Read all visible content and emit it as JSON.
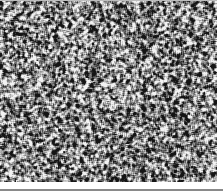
{
  "image": {
    "description": "grayscale speckle texture",
    "width": 217,
    "height": 182,
    "palette": {
      "dark": "#141414",
      "mid": "#8c8c8c",
      "light": "#f2f2f2"
    },
    "seed": 1337
  }
}
